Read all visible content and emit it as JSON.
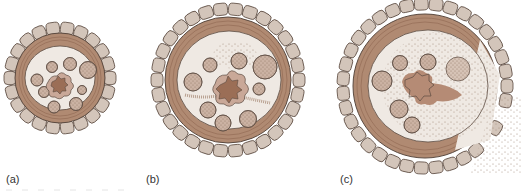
{
  "figure": {
    "panels": [
      {
        "id": "a",
        "label": "(a)",
        "description": "intact cross-section",
        "cx": 60,
        "cy": 78,
        "outer_r": 56
      },
      {
        "id": "b",
        "label": "(b)",
        "description": "early damage with speckled infection spreading",
        "cx": 228,
        "cy": 80,
        "outer_r": 77
      },
      {
        "id": "c",
        "label": "(c)",
        "description": "advanced damage with ruptured outer layer",
        "cx": 425,
        "cy": 86,
        "outer_r": 88
      }
    ],
    "colors": {
      "cell_fill": "#d3c5ba",
      "cell_stroke": "#5b4a40",
      "band": "#b08a72",
      "band_dark": "#8f6650",
      "interior": "#efe9e3",
      "bundle_fill": "#cbb2a3",
      "core": "#9b6e56",
      "core_halo": "#c9a898",
      "speckle": "#a8917f"
    }
  }
}
